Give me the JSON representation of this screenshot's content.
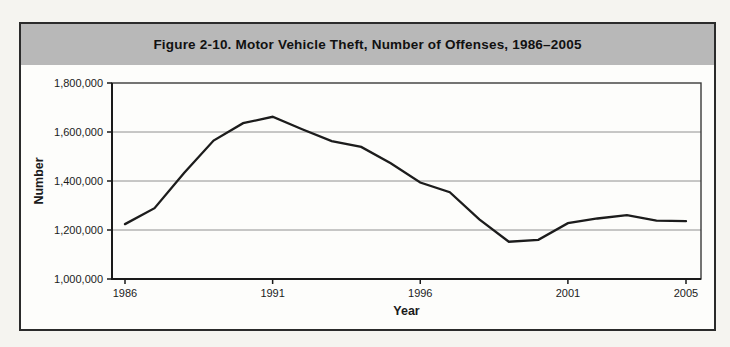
{
  "figure": {
    "title": "Figure 2-10. Motor Vehicle Theft, Number of Offenses, 1986–2005"
  },
  "chart_data": {
    "type": "line",
    "title": "Figure 2-10. Motor Vehicle Theft, Number of Offenses, 1986–2005",
    "xlabel": "Year",
    "ylabel": "Number",
    "series_name": "Motor vehicle theft offenses",
    "x": [
      1986,
      1987,
      1988,
      1989,
      1990,
      1991,
      1992,
      1993,
      1994,
      1995,
      1996,
      1997,
      1998,
      1999,
      2000,
      2001,
      2002,
      2003,
      2004,
      2005
    ],
    "values": [
      1224000,
      1289000,
      1433000,
      1565000,
      1636000,
      1662000,
      1611000,
      1563000,
      1539000,
      1472000,
      1394000,
      1354000,
      1243000,
      1152000,
      1160000,
      1228000,
      1247000,
      1261000,
      1238000,
      1236000
    ],
    "ylim": [
      1000000,
      1800000
    ],
    "ytick_step": 200000,
    "yticks": [
      1000000,
      1200000,
      1400000,
      1600000,
      1800000
    ],
    "ytick_labels": [
      "1,000,000",
      "1,200,000",
      "1,400,000",
      "1,600,000",
      "1,800,000"
    ],
    "xticks": [
      1986,
      1991,
      1996,
      2001,
      2005
    ],
    "grid": true,
    "legend": "none",
    "line_color": "#1c1c1c",
    "grid_color": "#909090",
    "plot_border_color": "#3a3a3a",
    "axis_color": "#1a1a1a"
  },
  "colors": {
    "page_bg": "#f5f4f0",
    "figure_bg": "#fdfdfb",
    "figure_border": "#2b2b2b",
    "header_band": "#b8b8b8",
    "title_text": "#111111"
  }
}
